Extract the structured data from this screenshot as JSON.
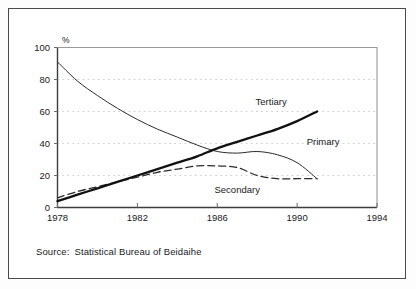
{
  "figure": {
    "source_prefix": "Source:",
    "source_text": "Statistical Bureau of Beidaihe"
  },
  "chart_data": {
    "type": "line",
    "title": "",
    "xlabel": "",
    "ylabel": "%",
    "xlim": [
      1978,
      1994
    ],
    "ylim": [
      0,
      100
    ],
    "grid": "dotted-horizontal",
    "legend": "inline-labels",
    "x_ticks": [
      "1978",
      "1982",
      "1986",
      "1990",
      "1994"
    ],
    "x_tick_values": [
      1978,
      1982,
      1986,
      1990,
      1994
    ],
    "y_ticks": [
      "0",
      "20",
      "40",
      "60",
      "80",
      "100"
    ],
    "y_tick_values": [
      0,
      20,
      40,
      60,
      80,
      100
    ],
    "x": [
      1978,
      1979,
      1980,
      1981,
      1982,
      1983,
      1984,
      1985,
      1986,
      1987,
      1988,
      1989,
      1990,
      1991
    ],
    "series": [
      {
        "name": "Primary",
        "style": "thin-solid",
        "color": "#2b2b2b",
        "label_x": 1991.3,
        "label_y": 41,
        "values": [
          91,
          79,
          70,
          62,
          55,
          49,
          44,
          39,
          35,
          34,
          35,
          33,
          28,
          18
        ]
      },
      {
        "name": "Secondary",
        "style": "long-dashed",
        "color": "#2b2b2b",
        "label_x": 1987.0,
        "label_y": 11,
        "values": [
          6,
          10,
          13,
          16,
          19,
          22,
          24,
          26,
          26,
          25,
          20,
          18,
          18,
          18
        ]
      },
      {
        "name": "Tertiary",
        "style": "thick-solid",
        "color": "#111111",
        "label_x": 1988.7,
        "label_y": 66,
        "values": [
          4,
          8,
          12,
          16,
          20,
          24,
          28,
          32,
          37,
          41,
          45,
          49,
          54,
          60
        ]
      }
    ]
  }
}
